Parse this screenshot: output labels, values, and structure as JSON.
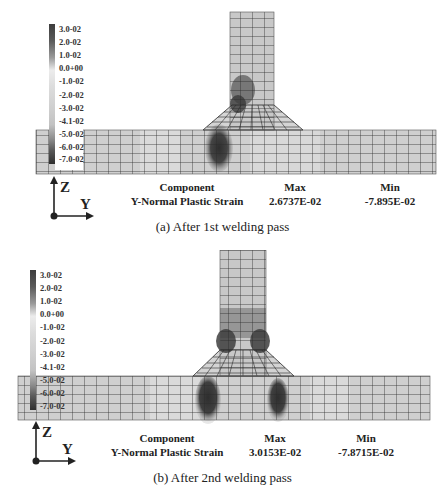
{
  "figures": [
    {
      "id": "a",
      "caption": "(a) After 1st welding pass",
      "legend": {
        "ticks": [
          "3.0-02",
          "2.0-02",
          "1.0-02",
          "0.0+00",
          "-1.0-02",
          "-2.0-02",
          "-3.0-02",
          "-4.1-02",
          "-5.0-02",
          "-6.0-02",
          "-7.0-02"
        ]
      },
      "info": {
        "component_header": "Component",
        "component_value": "Y-Normal Plastic Strain",
        "max_header": "Max",
        "max_value": "2.6737E-02",
        "min_header": "Min",
        "min_value": "-7.895E-02"
      },
      "axes": {
        "vertical": "Z",
        "horizontal": "Y"
      }
    },
    {
      "id": "b",
      "caption": "(b) After 2nd welding pass",
      "legend": {
        "ticks": [
          "3.0-02",
          "2.0-02",
          "1.0-02",
          "0.0+00",
          "-1.0-02",
          "-2.0-02",
          "-3.0-02",
          "-4.1-02",
          "-5.0-02",
          "-6.0-02",
          "-7.0-02"
        ]
      },
      "info": {
        "component_header": "Component",
        "component_value": "Y-Normal Plastic Strain",
        "max_header": "Max",
        "max_value": "3.0153E-02",
        "min_header": "Min",
        "min_value": "-7.8715E-02"
      },
      "axes": {
        "vertical": "Z",
        "horizontal": "Y"
      }
    }
  ],
  "colors": {
    "mesh_fill": "#c9c9c9",
    "mesh_line": "#2a2a2a",
    "hot_dark": "#3a3a3a",
    "hot_mid": "#6a6a6a"
  }
}
